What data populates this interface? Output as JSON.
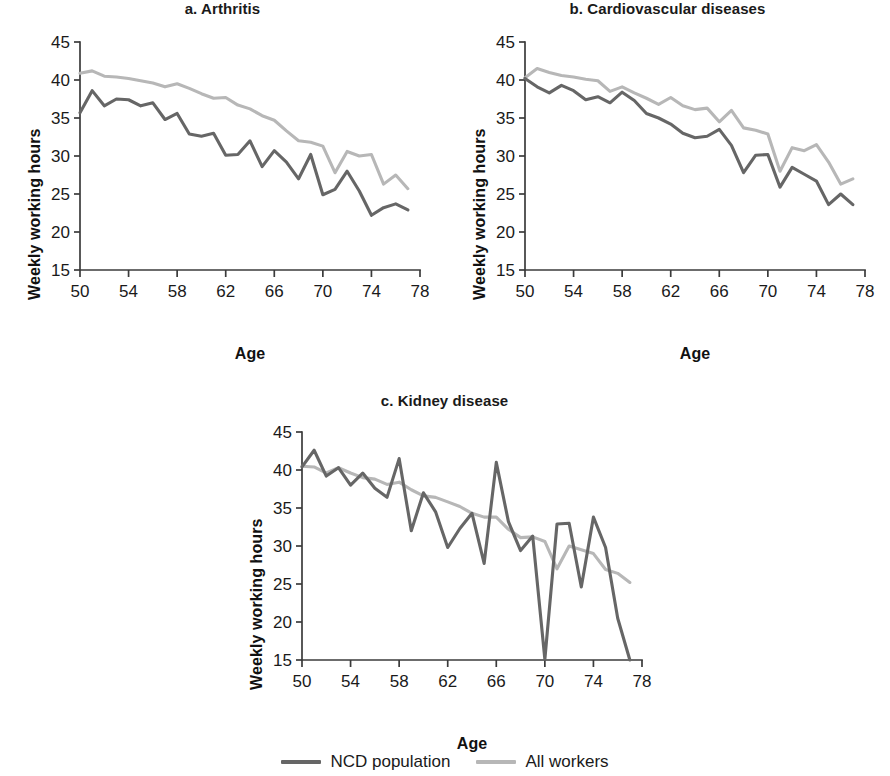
{
  "figure": {
    "ylabel": "Weekly working hours",
    "xlabel": "Age",
    "colors": {
      "ncd_population": "#666666",
      "all_workers": "#b7b7b7",
      "axis": "#3b3b3b",
      "text": "#1a1a1a",
      "background": "#ffffff"
    },
    "legend": {
      "position": "bottom-center",
      "items": [
        {
          "label": "NCD population",
          "color": "#666666",
          "swatch": "line-swatch-ncd"
        },
        {
          "label": "All workers",
          "color": "#b7b7b7",
          "swatch": "line-swatch-all"
        }
      ]
    },
    "axis": {
      "x_ticks": [
        50,
        54,
        58,
        62,
        66,
        70,
        74,
        78
      ],
      "x_tick_labels": [
        "50",
        "54",
        "58",
        "62",
        "66",
        "70",
        "74",
        "78"
      ],
      "y_ticks": [
        15,
        20,
        25,
        30,
        35,
        40,
        45
      ],
      "y_tick_labels": [
        "15",
        "20",
        "25",
        "30",
        "35",
        "40",
        "45"
      ],
      "xlim": [
        50,
        78
      ],
      "ylim": [
        15,
        45
      ],
      "grid": false
    }
  },
  "chart_data": [
    {
      "type": "line",
      "panel": "a",
      "title": "a. Arthritis",
      "xlabel": "Age",
      "ylabel": "Weekly working hours",
      "xlim": [
        50,
        78
      ],
      "ylim": [
        15,
        45
      ],
      "grid": false,
      "legend_position": "figure-bottom",
      "x": [
        50,
        51,
        52,
        53,
        54,
        55,
        56,
        57,
        58,
        59,
        60,
        61,
        62,
        63,
        64,
        65,
        66,
        67,
        68,
        69,
        70,
        71,
        72,
        73,
        74,
        75,
        76,
        77
      ],
      "series": [
        {
          "name": "NCD population",
          "color": "#666666",
          "values": [
            35.7,
            38.6,
            36.6,
            37.5,
            37.4,
            36.6,
            37.0,
            34.8,
            35.6,
            32.9,
            32.6,
            33.0,
            30.1,
            30.2,
            32.0,
            28.6,
            30.7,
            29.2,
            27.0,
            30.2,
            24.9,
            25.6,
            28.0,
            25.4,
            22.2,
            23.2,
            23.7,
            22.9
          ]
        },
        {
          "name": "All workers",
          "color": "#b7b7b7",
          "values": [
            40.9,
            41.2,
            40.5,
            40.4,
            40.2,
            39.9,
            39.6,
            39.1,
            39.5,
            38.9,
            38.2,
            37.6,
            37.7,
            36.7,
            36.2,
            35.3,
            34.7,
            33.3,
            32.0,
            31.8,
            31.3,
            27.8,
            30.6,
            30.0,
            30.2,
            26.3,
            27.5,
            25.7
          ]
        }
      ]
    },
    {
      "type": "line",
      "panel": "b",
      "title": "b. Cardiovascular diseases",
      "xlabel": "Age",
      "ylabel": "Weekly working hours",
      "xlim": [
        50,
        78
      ],
      "ylim": [
        15,
        45
      ],
      "grid": false,
      "legend_position": "figure-bottom",
      "x": [
        50,
        51,
        52,
        53,
        54,
        55,
        56,
        57,
        58,
        59,
        60,
        61,
        62,
        63,
        64,
        65,
        66,
        67,
        68,
        69,
        70,
        71,
        72,
        73,
        74,
        75,
        76,
        77
      ],
      "series": [
        {
          "name": "NCD population",
          "color": "#666666",
          "values": [
            40.2,
            39.1,
            38.3,
            39.3,
            38.6,
            37.4,
            37.8,
            37.0,
            38.4,
            37.3,
            35.6,
            35.0,
            34.2,
            33.0,
            32.4,
            32.6,
            33.5,
            31.4,
            27.8,
            30.1,
            30.2,
            25.9,
            28.5,
            27.6,
            26.7,
            23.6,
            25.0,
            23.6
          ]
        },
        {
          "name": "All workers",
          "color": "#b7b7b7",
          "values": [
            40.3,
            41.5,
            41.0,
            40.6,
            40.4,
            40.1,
            39.9,
            38.5,
            39.1,
            38.3,
            37.6,
            36.8,
            37.7,
            36.6,
            36.1,
            36.3,
            34.5,
            36.0,
            33.7,
            33.4,
            32.9,
            28.0,
            31.1,
            30.7,
            31.5,
            29.2,
            26.3,
            27.0
          ]
        }
      ]
    },
    {
      "type": "line",
      "panel": "c",
      "title": "c. Kidney disease",
      "xlabel": "Age",
      "ylabel": "Weekly working hours",
      "xlim": [
        50,
        78
      ],
      "ylim": [
        15,
        45
      ],
      "grid": false,
      "legend_position": "figure-bottom",
      "x": [
        50,
        51,
        52,
        53,
        54,
        55,
        56,
        57,
        58,
        59,
        60,
        61,
        62,
        63,
        64,
        65,
        66,
        67,
        68,
        69,
        70,
        71,
        72,
        73,
        74,
        75,
        76,
        77
      ],
      "series": [
        {
          "name": "NCD population",
          "color": "#666666",
          "values": [
            40.4,
            42.6,
            39.2,
            40.3,
            38.0,
            39.6,
            37.6,
            36.4,
            41.5,
            32.0,
            37.0,
            34.5,
            29.8,
            32.3,
            34.3,
            27.7,
            41.0,
            33.2,
            29.4,
            31.3,
            15.1,
            32.9,
            33.0,
            24.6,
            33.8,
            29.8,
            20.5,
            15.0
          ]
        },
        {
          "name": "All workers",
          "color": "#b7b7b7",
          "values": [
            40.5,
            40.4,
            39.6,
            40.3,
            39.6,
            39.0,
            38.8,
            38.1,
            38.4,
            37.4,
            36.6,
            36.4,
            35.8,
            35.2,
            34.3,
            33.8,
            33.8,
            32.2,
            31.1,
            31.2,
            30.6,
            27.0,
            30.0,
            29.5,
            29.0,
            26.9,
            26.4,
            25.2
          ]
        }
      ]
    }
  ]
}
